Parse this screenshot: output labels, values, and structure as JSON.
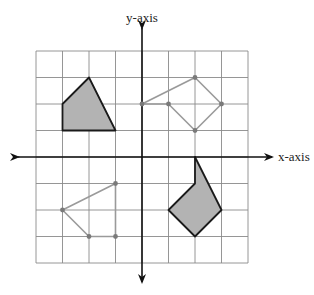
{
  "diagram": {
    "x_axis_label": "x-axis",
    "y_axis_label": "y-axis",
    "grid": {
      "min": -4,
      "max": 4,
      "step": 1,
      "origin_px": [
        142,
        157
      ],
      "unit_px": 26.5
    },
    "colors": {
      "grid": "#8a8a8a",
      "axis": "#111111",
      "shaded_fill": "#b3b3b3",
      "shaded_stroke": "#1a1a1a",
      "outline_stroke": "#9a9a9a",
      "vertex_dot": "#7a7a7a"
    },
    "shapes": [
      {
        "name": "shaded-polygon-quadrant-2",
        "style": "shaded",
        "vertices": [
          [
            -3,
            1
          ],
          [
            -3,
            2
          ],
          [
            -2,
            3
          ],
          [
            -1,
            1
          ]
        ]
      },
      {
        "name": "shaded-polygon-quadrant-4",
        "style": "shaded",
        "vertices": [
          [
            2,
            0
          ],
          [
            2,
            -1
          ],
          [
            1,
            -2
          ],
          [
            2,
            -3
          ],
          [
            3,
            -2
          ]
        ]
      },
      {
        "name": "outline-polygon-quadrant-1",
        "style": "outline",
        "vertices": [
          [
            0,
            2
          ],
          [
            1,
            2
          ],
          [
            2,
            1
          ],
          [
            3,
            2
          ],
          [
            2,
            3
          ]
        ]
      },
      {
        "name": "outline-polygon-quadrant-3",
        "style": "outline",
        "vertices": [
          [
            -1,
            -1
          ],
          [
            -3,
            -2
          ],
          [
            -2,
            -3
          ],
          [
            -1,
            -3
          ]
        ]
      }
    ]
  }
}
